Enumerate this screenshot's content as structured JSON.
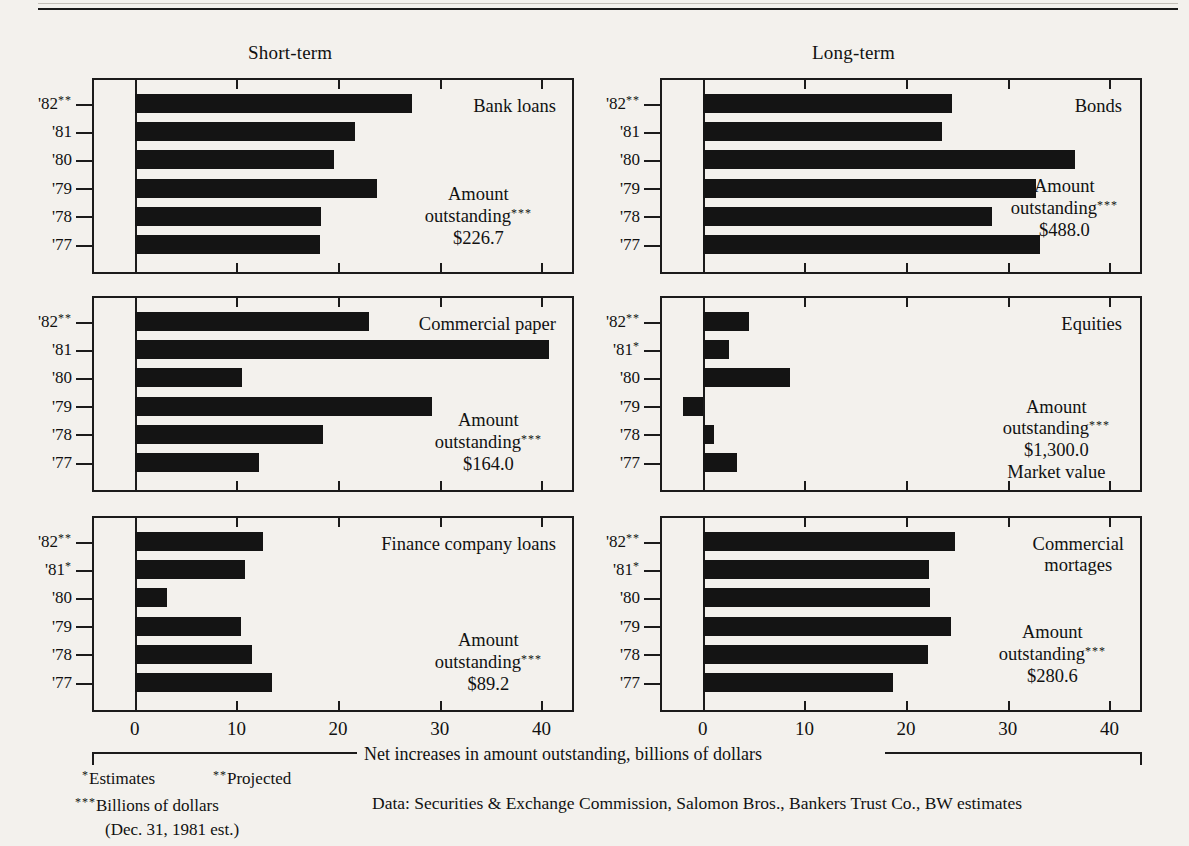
{
  "headers": {
    "left_column": "Short-term",
    "right_column": "Long-term"
  },
  "axis": {
    "ticks": [
      "0",
      "10",
      "20",
      "30",
      "40"
    ],
    "tick_values": [
      0,
      10,
      20,
      30,
      40
    ],
    "min": -4,
    "max": 43,
    "caption": "Net increases in amount outstanding, billions of dollars"
  },
  "years": [
    "'82",
    "'81",
    "'80",
    "'79",
    "'78",
    "'77"
  ],
  "footnotes": {
    "estimates": "Estimates",
    "estimates_mark": "*",
    "projected": "Projected",
    "projected_mark": "**",
    "billions": "Billions of dollars",
    "billions_mark": "***",
    "billions_sub": "(Dec. 31, 1981 est.)",
    "data_source": "Data: Securities & Exchange Commission, Salomon Bros., Bankers Trust Co., BW estimates"
  },
  "chart_data": {
    "type": "bar",
    "title": "Net increases in amount outstanding, billions of dollars",
    "xlabel": "Net increases in amount outstanding, billions of dollars",
    "ylabel": "",
    "xlim": [
      -4,
      43
    ],
    "grid": true,
    "orientation": "horizontal",
    "categories": [
      "'82",
      "'81",
      "'80",
      "'79",
      "'78",
      "'77"
    ],
    "panels": [
      {
        "id": "bank-loans",
        "column": "Short-term",
        "name": "Bank loans",
        "amount_label": "Amount",
        "outstanding_label": "outstanding",
        "outstanding_mark": "***",
        "amount_value": "$226.7",
        "note": "",
        "year_marks": [
          "**",
          "",
          "",
          "",
          "",
          ""
        ],
        "values": [
          27.3,
          21.7,
          19.6,
          23.8,
          18.3,
          18.2
        ]
      },
      {
        "id": "commercial-paper",
        "column": "Short-term",
        "name": "Commercial paper",
        "amount_label": "Amount",
        "outstanding_label": "outstanding",
        "outstanding_mark": "***",
        "amount_value": "$164.0",
        "note": "",
        "year_marks": [
          "**",
          "",
          "",
          "",
          "",
          ""
        ],
        "values": [
          23.0,
          40.7,
          10.6,
          29.2,
          18.5,
          12.2
        ]
      },
      {
        "id": "finance-company-loans",
        "column": "Short-term",
        "name": "Finance company loans",
        "amount_label": "Amount",
        "outstanding_label": "outstanding",
        "outstanding_mark": "***",
        "amount_value": "$89.2",
        "note": "",
        "year_marks": [
          "**",
          "*",
          "",
          "",
          "",
          ""
        ],
        "values": [
          12.6,
          10.8,
          3.2,
          10.5,
          11.5,
          13.5
        ]
      },
      {
        "id": "bonds",
        "column": "Long-term",
        "name": "Bonds",
        "amount_label": "Amount",
        "outstanding_label": "outstanding",
        "outstanding_mark": "***",
        "amount_value": "$488.0",
        "note": "",
        "year_marks": [
          "**",
          "",
          "",
          "",
          "",
          ""
        ],
        "values": [
          24.5,
          23.5,
          36.6,
          32.8,
          28.4,
          33.2
        ]
      },
      {
        "id": "equities",
        "column": "Long-term",
        "name": "Equities",
        "amount_label": "Amount",
        "outstanding_label": "outstanding",
        "outstanding_mark": "***",
        "amount_value": "$1,300.0",
        "note": "Market value",
        "year_marks": [
          "**",
          "*",
          "",
          "",
          "",
          ""
        ],
        "values": [
          4.6,
          2.6,
          8.6,
          -1.9,
          1.1,
          3.4
        ]
      },
      {
        "id": "commercial-mortages",
        "column": "Long-term",
        "name": "Commercial\nmortages",
        "amount_label": "Amount",
        "outstanding_label": "outstanding",
        "outstanding_mark": "***",
        "amount_value": "$280.6",
        "note": "",
        "year_marks": [
          "**",
          "*",
          "",
          "",
          "",
          ""
        ],
        "values": [
          24.8,
          22.3,
          22.4,
          24.4,
          22.2,
          18.7
        ]
      }
    ]
  }
}
